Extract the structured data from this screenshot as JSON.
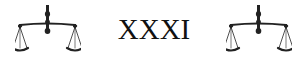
{
  "heading": {
    "chapter_numeral": "XXXI"
  },
  "ornaments": {
    "left_icon": "scales-of-justice-icon",
    "right_icon": "scales-of-justice-icon"
  }
}
